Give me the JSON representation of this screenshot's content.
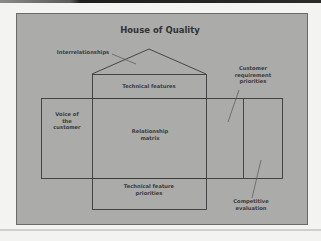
{
  "title": "House of Quality",
  "labels": {
    "interrelationships": "Interrelationships",
    "technical_features": "Technical features",
    "customer_requirement_priorities": "Customer\nrequirement\npriorities",
    "voice_of_customer": "Voice of\nthe\ncustomer",
    "relationship_matrix": "Relationship\nmatrix",
    "technical_feature_priorities": "Technical feature\npriorities",
    "competitive_evaluation": "Competitive\nevaluation"
  },
  "colors": {
    "panel": "#ababaa",
    "lines": "#3a3a3a",
    "text": "#3a3a3a",
    "background": "#f3f3f1"
  }
}
